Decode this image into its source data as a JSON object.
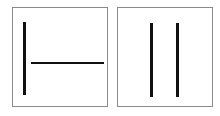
{
  "diagram": {
    "panels": [
      {
        "id": "left",
        "box": {
          "x": 12,
          "y": 7,
          "w": 96,
          "h": 100
        },
        "lines": [
          {
            "orientation": "vertical",
            "x": 23,
            "y": 22,
            "w": 3,
            "h": 73
          },
          {
            "orientation": "horizontal",
            "x": 31,
            "y": 62,
            "w": 73,
            "h": 2
          }
        ]
      },
      {
        "id": "right",
        "box": {
          "x": 117,
          "y": 7,
          "w": 96,
          "h": 100
        },
        "lines": [
          {
            "orientation": "vertical",
            "x": 150,
            "y": 23,
            "w": 3,
            "h": 74
          },
          {
            "orientation": "vertical",
            "x": 176,
            "y": 23,
            "w": 3,
            "h": 74
          }
        ]
      }
    ],
    "colors": {
      "border": "#8a8a8a",
      "line": "#111111",
      "background": "#ffffff"
    }
  }
}
